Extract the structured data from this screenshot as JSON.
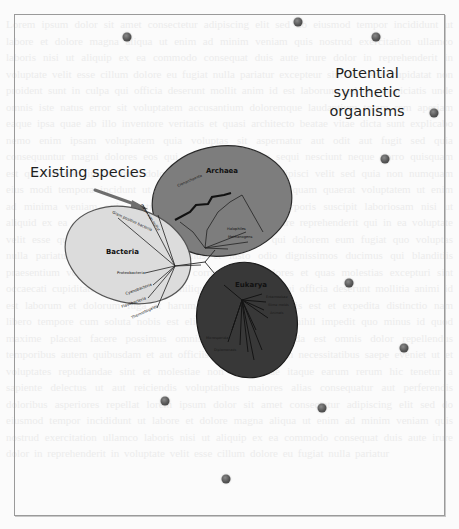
{
  "diagram": {
    "title_labels": {
      "synthetic": "Potential synthetic organisms",
      "synthetic_line1": "Potential synthetic",
      "synthetic_line2": "organisms",
      "existing": "Existing species"
    },
    "domains": [
      {
        "name": "Bacteria",
        "fill": "#dcdcdc",
        "branches": [
          "Green non-sulfur bacteria",
          "Green sulfur bacteria",
          "Deinoc",
          "Gram positive bacteria",
          "Proteobacteria",
          "Cyanobacteria",
          "Flavobacteria",
          "Thermotogales"
        ]
      },
      {
        "name": "Archaea",
        "fill": "#7d7d7d",
        "branches": [
          "Crenarchaeota",
          "Methanococcales",
          "Methanobacteriales",
          "Halophiles",
          "Methanogens",
          "Thermoplasmales"
        ]
      },
      {
        "name": "Eukarya",
        "fill": "#383838",
        "branches": [
          "Entamoebae",
          "Slime molds",
          "Animals",
          "Fungi",
          "Plants",
          "Ciliates",
          "Flagellates",
          "Trichomonads",
          "Microsporidia",
          "Diplomonads"
        ]
      }
    ],
    "synthetic_dots": [
      {
        "x": 127,
        "y": 37
      },
      {
        "x": 298,
        "y": 22
      },
      {
        "x": 376,
        "y": 37
      },
      {
        "x": 434,
        "y": 113
      },
      {
        "x": 385,
        "y": 159
      },
      {
        "x": 349,
        "y": 283
      },
      {
        "x": 404,
        "y": 348
      },
      {
        "x": 165,
        "y": 401
      },
      {
        "x": 322,
        "y": 408
      },
      {
        "x": 226,
        "y": 479
      }
    ],
    "colors": {
      "dot": "#555555",
      "arrow": "#6e6e6e",
      "frame": "#9a9a9a",
      "text": "#1e1e1e"
    }
  }
}
